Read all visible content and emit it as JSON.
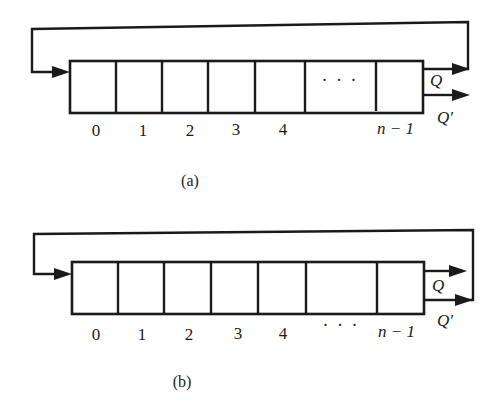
{
  "figure": {
    "type": "ring-counter-diagrams",
    "diagrams": [
      {
        "caption": "(a)",
        "cell_labels": [
          "0",
          "1",
          "2",
          "3",
          "4",
          "n − 1"
        ],
        "ellipsis": "· · ·",
        "ellipsis_position": "inside-cell",
        "outputs": {
          "q": "Q",
          "q_prime": "Q′"
        },
        "feedback_from": "Q",
        "feedback_to": "cell 0 input"
      },
      {
        "caption": "(b)",
        "cell_labels": [
          "0",
          "1",
          "2",
          "3",
          "4",
          "n − 1"
        ],
        "ellipsis": "· · ·",
        "ellipsis_position": "below-cell",
        "outputs": {
          "q": "Q",
          "q_prime": "Q′"
        },
        "feedback_from": "Q′",
        "feedback_to": "cell 0 input"
      }
    ]
  }
}
